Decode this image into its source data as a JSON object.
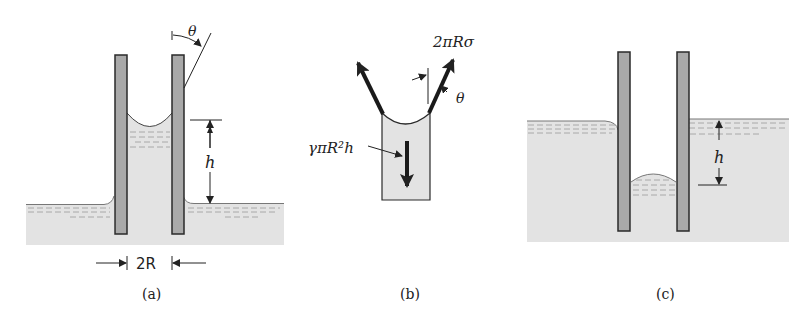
{
  "figure": {
    "colors": {
      "liquid": "#e3e3e3",
      "tube": "#a9a9a9",
      "outline": "#2a2a2a",
      "dash": "#9a9a9a"
    },
    "panels": [
      {
        "id": "a",
        "caption": "(a)",
        "labels": {
          "angle": "θ",
          "height": "h",
          "width": "2R"
        },
        "description": "Capillary rise: liquid column of height h in a tube of diameter 2R, concave meniscus, contact angle θ"
      },
      {
        "id": "b",
        "caption": "(b)",
        "labels": {
          "surface_force": "2πRσ",
          "angle": "θ",
          "weight": "γπR²h"
        },
        "description": "Free-body diagram of the raised liquid column: surface tension force 2πRσ at angle θ balances weight γπR²h"
      },
      {
        "id": "c",
        "caption": "(c)",
        "labels": {
          "height": "h"
        },
        "description": "Capillary depression: liquid level in tube is h below outside surface, convex meniscus"
      }
    ]
  }
}
